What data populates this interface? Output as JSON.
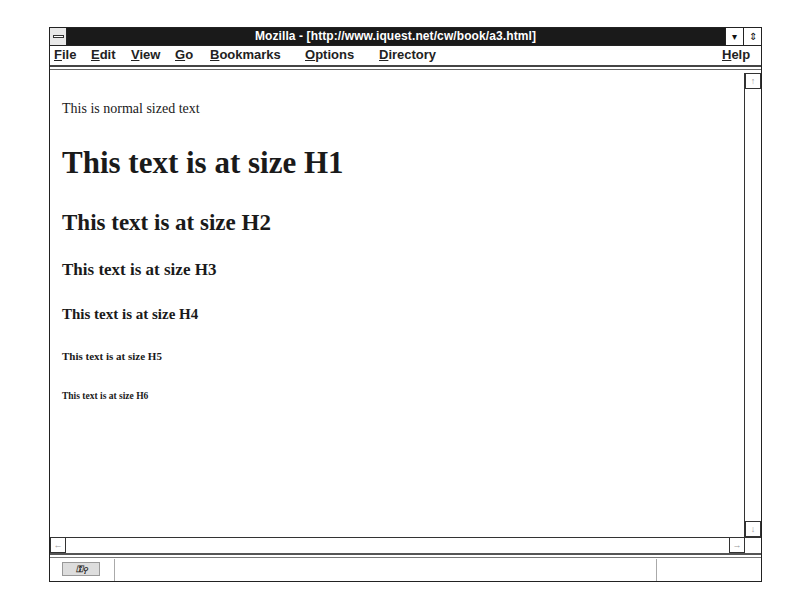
{
  "window": {
    "title": "Mozilla - [http://www.iquest.net/cw/book/a3.html]",
    "minimize_icon": "▾",
    "maximize_icon": "⇕"
  },
  "menubar": {
    "items": [
      {
        "label": "File",
        "accel": "F",
        "rest": "ile"
      },
      {
        "label": "Edit",
        "accel": "E",
        "rest": "dit"
      },
      {
        "label": "View",
        "accel": "V",
        "rest": "iew"
      },
      {
        "label": "Go",
        "accel": "G",
        "rest": "o"
      },
      {
        "label": "Bookmarks",
        "accel": "B",
        "rest": "ookmarks"
      },
      {
        "label": "Options",
        "accel": "O",
        "rest": "ptions"
      },
      {
        "label": "Directory",
        "accel": "D",
        "rest": "irectory"
      }
    ],
    "help": {
      "label": "Help",
      "accel": "H",
      "rest": "elp"
    }
  },
  "content": {
    "normal": "This is normal sized text",
    "h1": "This text is at size H1",
    "h2": "This text is at size H2",
    "h3": "This text is at size H3",
    "h4": "This text is at size H4",
    "h5": "This text is at size H5",
    "h6": "This text is at size H6"
  },
  "scrollbars": {
    "up_arrow": "↑",
    "down_arrow": "↓",
    "left_arrow": "←",
    "right_arrow": "→"
  },
  "statusbar": {
    "security_icon": "⚿⚲",
    "status_text": "",
    "progress_text": ""
  }
}
